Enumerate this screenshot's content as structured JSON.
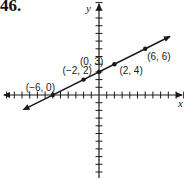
{
  "problem_number": "46.",
  "chart_data": {
    "type": "line",
    "title": "",
    "xlabel": "x",
    "ylabel": "y",
    "xlim": [
      -12,
      11
    ],
    "ylim": [
      -11,
      12
    ],
    "grid": false,
    "points": [
      {
        "x": -6,
        "y": 0,
        "label": "(−6, 0)"
      },
      {
        "x": -2,
        "y": 2,
        "label": "(−2, 2)"
      },
      {
        "x": 0,
        "y": 3,
        "label": "(0, 3)"
      },
      {
        "x": 2,
        "y": 4,
        "label": "(2, 4)"
      },
      {
        "x": 6,
        "y": 6,
        "label": "(6, 6)"
      }
    ],
    "line": {
      "slope": 0.5,
      "intercept": 3,
      "arrows": "both"
    }
  },
  "colors": {
    "ink": "#1a1a1a",
    "background": "#ffffff"
  }
}
